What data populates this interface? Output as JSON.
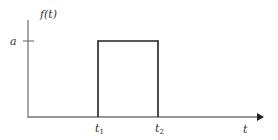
{
  "diagram": {
    "type": "rectangular pulse",
    "y_axis_label": "f(t)",
    "x_axis_label": "t",
    "amplitude_label": "a",
    "start_label": {
      "base": "t",
      "sub": "1"
    },
    "end_label": {
      "base": "t",
      "sub": "2"
    },
    "colors": {
      "axis": "#777777",
      "pulse": "#222222",
      "text": "#333333"
    }
  }
}
